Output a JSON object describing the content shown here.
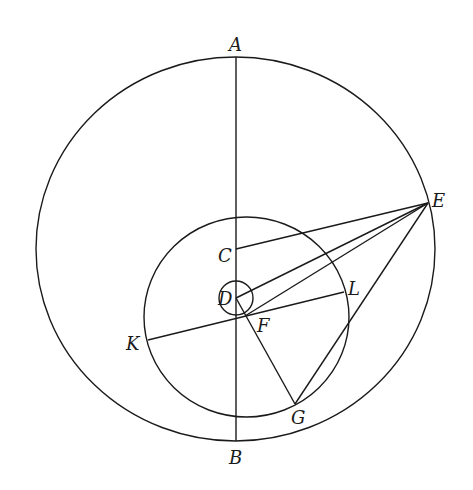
{
  "diagram": {
    "type": "geometric-construction",
    "stroke_color": "#1a1a1a",
    "background": "#ffffff",
    "circles": [
      {
        "id": "outer",
        "cx": 235.5,
        "cy": 249,
        "rx": 199.5,
        "ry": 192
      },
      {
        "id": "inner",
        "cx": 246.5,
        "cy": 317,
        "rx": 102.5,
        "ry": 100
      },
      {
        "id": "small",
        "cx": 236,
        "cy": 298,
        "rx": 17,
        "ry": 17
      }
    ],
    "segments": [
      {
        "id": "AB",
        "from": "A",
        "to": "B"
      },
      {
        "id": "EC",
        "from": "E",
        "to": "C"
      },
      {
        "id": "ED",
        "from": "E",
        "to": "D"
      },
      {
        "id": "EF",
        "from": "E",
        "to": "F"
      },
      {
        "id": "EG",
        "from": "E",
        "to": "G"
      },
      {
        "id": "KL",
        "from": "K",
        "to": "L"
      },
      {
        "id": "DG",
        "from": "D",
        "to": "G"
      }
    ],
    "points": {
      "A": {
        "x": 236,
        "y": 57
      },
      "B": {
        "x": 236,
        "y": 441
      },
      "C": {
        "x": 236,
        "y": 249
      },
      "D": {
        "x": 236,
        "y": 298
      },
      "E": {
        "x": 428,
        "y": 203
      },
      "F": {
        "x": 245,
        "y": 316
      },
      "G": {
        "x": 295,
        "y": 404
      },
      "K": {
        "x": 148,
        "y": 340
      },
      "L": {
        "x": 344,
        "y": 292
      }
    },
    "labels": [
      {
        "text": "A",
        "x": 229,
        "y": 51
      },
      {
        "text": "B",
        "x": 229,
        "y": 464
      },
      {
        "text": "C",
        "x": 218,
        "y": 262
      },
      {
        "text": "D",
        "x": 218,
        "y": 305
      },
      {
        "text": "E",
        "x": 432,
        "y": 207
      },
      {
        "text": "F",
        "x": 257,
        "y": 332
      },
      {
        "text": "G",
        "x": 291,
        "y": 424
      },
      {
        "text": "K",
        "x": 126,
        "y": 350
      },
      {
        "text": "L",
        "x": 348,
        "y": 295
      }
    ]
  }
}
